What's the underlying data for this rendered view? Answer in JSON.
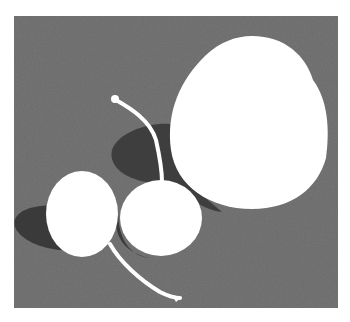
{
  "image": {
    "description": "Monochrome still-life painting of one large round fruit and two cherries joined by stems on a mottled gray background",
    "colors": {
      "background": "#ffffff",
      "canvas": "#7a7a7a",
      "canvas_dark": "#5e5e5e",
      "shadow": "#3c3c3c",
      "fruit": "#ffffff"
    },
    "objects": [
      {
        "name": "large-fruit",
        "cx": 249,
        "cy": 122,
        "rx": 79,
        "ry": 87
      },
      {
        "name": "left-cherry",
        "cx": 82,
        "cy": 214,
        "rx": 36,
        "ry": 43
      },
      {
        "name": "right-cherry",
        "cx": 161,
        "cy": 218,
        "rx": 41,
        "ry": 38
      }
    ]
  }
}
